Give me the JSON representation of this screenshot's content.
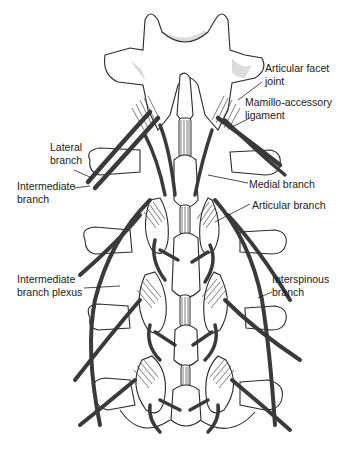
{
  "figure": {
    "colors": {
      "nerve": "#3a3a3a",
      "bone_outline": "#2a2a2a",
      "shading": "#d6d6d6",
      "background": "#ffffff"
    }
  },
  "labels": [
    {
      "id": "articular-facet-joint",
      "text": "Articular facet\njoint"
    },
    {
      "id": "mamillo-accessory-ligament",
      "text": "Mamillo-accessory\nligament"
    },
    {
      "id": "lateral-branch",
      "text": "Lateral\nbranch"
    },
    {
      "id": "intermediate-branch",
      "text": "Intermediate\nbranch"
    },
    {
      "id": "medial-branch",
      "text": "Medial branch"
    },
    {
      "id": "articular-branch",
      "text": "Articular branch"
    },
    {
      "id": "intermediate-branch-plexus",
      "text": "Intermediate\nbranch plexus"
    },
    {
      "id": "interspinous-branch",
      "text": "Interspinous\nbranch"
    }
  ]
}
